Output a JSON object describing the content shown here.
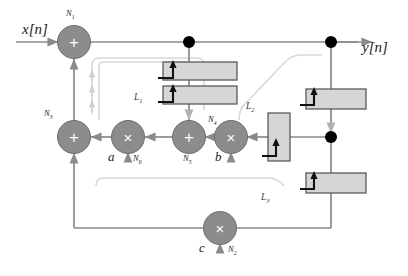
{
  "diagram": {
    "type": "signal-flow-graph",
    "colors": {
      "node_fill": "#8c8c8c",
      "node_stroke": "#6e6e6e",
      "block_fill": "#d6d6d6",
      "block_stroke": "#5a5a5a",
      "line": "#8a8a8a",
      "loop_line": "#d0d0d0",
      "dot": "#000000",
      "text": "#1a1a1a"
    },
    "io": {
      "input_label": "x[n]",
      "output_label": "y[n]"
    },
    "nodes": [
      {
        "id": "N1",
        "kind": "adder",
        "symbol": "+",
        "label": "N",
        "sub": "1",
        "x": 74,
        "y": 42
      },
      {
        "id": "N3",
        "kind": "adder",
        "symbol": "+",
        "label": "N",
        "sub": "3",
        "x": 74,
        "y": 137
      },
      {
        "id": "N6",
        "kind": "multiplier",
        "symbol": "×",
        "label": "N",
        "sub": "6",
        "x": 128,
        "y": 137
      },
      {
        "id": "N5",
        "kind": "adder",
        "symbol": "+",
        "label": "N",
        "sub": "5",
        "x": 189,
        "y": 137
      },
      {
        "id": "N4",
        "kind": "multiplier",
        "symbol": "×",
        "label": "N",
        "sub": "4",
        "x": 231,
        "y": 137
      },
      {
        "id": "N2",
        "kind": "multiplier",
        "symbol": "×",
        "label": "N",
        "sub": "2",
        "x": 220,
        "y": 228
      }
    ],
    "coefficients": [
      {
        "id": "a",
        "label": "a",
        "node": "N",
        "sub": "6",
        "x": 111,
        "y": 156
      },
      {
        "id": "b",
        "label": "b",
        "node": "",
        "sub": "",
        "x": 219,
        "y": 156
      },
      {
        "id": "c",
        "label": "c",
        "node": "N",
        "sub": "2",
        "x": 203,
        "y": 247
      }
    ],
    "delay_blocks": [
      {
        "id": "D1",
        "x": 163,
        "y": 62,
        "w": 74,
        "h": 18,
        "orient": "horizontal"
      },
      {
        "id": "D2",
        "x": 163,
        "y": 86,
        "w": 74,
        "h": 18,
        "orient": "horizontal"
      },
      {
        "id": "D3",
        "x": 268,
        "y": 113,
        "w": 22,
        "h": 48,
        "orient": "vertical"
      },
      {
        "id": "D4",
        "x": 306,
        "y": 89,
        "w": 60,
        "h": 20,
        "orient": "horizontal"
      },
      {
        "id": "D5",
        "x": 306,
        "y": 173,
        "w": 60,
        "h": 20,
        "orient": "horizontal"
      }
    ],
    "junction_dots": [
      {
        "id": "J1",
        "x": 189,
        "y": 42
      },
      {
        "id": "J2",
        "x": 331,
        "y": 42
      },
      {
        "id": "J3",
        "x": 331,
        "y": 137
      }
    ],
    "loop_labels": [
      {
        "id": "L1",
        "label": "L",
        "sub": "1",
        "x": 137,
        "y": 97
      },
      {
        "id": "L2",
        "label": "L",
        "sub": "2",
        "x": 249,
        "y": 106
      },
      {
        "id": "L3",
        "label": "L",
        "sub": "3",
        "x": 264,
        "y": 197
      }
    ]
  }
}
